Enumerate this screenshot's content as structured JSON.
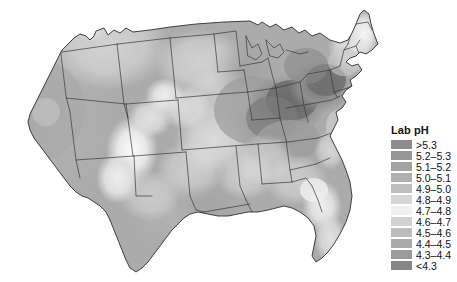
{
  "figure": {
    "type": "choropleth-map",
    "region": "contiguous-united-states",
    "background_color": "#ffffff",
    "border_color": "#3a3a3a"
  },
  "legend": {
    "title": "Lab pH",
    "position": "right",
    "entries": [
      {
        "label": ">5.3",
        "color": "#8c8c8c"
      },
      {
        "label": "5.2–5.3",
        "color": "#969696"
      },
      {
        "label": "5.1–5.2",
        "color": "#a3a3a3"
      },
      {
        "label": "5.0–5.1",
        "color": "#b0b0b0"
      },
      {
        "label": "4.9–5.0",
        "color": "#bfbfbf"
      },
      {
        "label": "4.8–4.9",
        "color": "#d6d6d6"
      },
      {
        "label": "4.7–4.8",
        "color": "#f0f0f0"
      },
      {
        "label": "4.6–4.7",
        "color": "#d2d2d2"
      },
      {
        "label": "4.5–4.6",
        "color": "#bcbcbc"
      },
      {
        "label": "4.4–4.5",
        "color": "#ababab"
      },
      {
        "label": "4.3–4.4",
        "color": "#9a9a9a"
      },
      {
        "label": "<4.3",
        "color": "#858585"
      }
    ]
  },
  "chart_data": {
    "type": "heatmap",
    "title": "Lab pH",
    "subtitle": "",
    "xlabel": "",
    "ylabel": "",
    "variable": "Lab pH",
    "units": "pH",
    "map_projection": "albers-equal-area-conic",
    "legend_position": "right",
    "grid": false,
    "value_range": [
      4.3,
      5.3
    ],
    "class_breaks": [
      4.3,
      4.4,
      4.5,
      4.6,
      4.7,
      4.8,
      4.9,
      5.0,
      5.1,
      5.2,
      5.3
    ],
    "class_labels": [
      ">5.3",
      "5.2–5.3",
      "5.1–5.2",
      "5.0–5.1",
      "4.9–5.0",
      "4.8–4.9",
      "4.7–4.8",
      "4.6–4.7",
      "4.5–4.6",
      "4.4–4.5",
      "4.3–4.4",
      "<4.3"
    ],
    "class_colors": [
      "#8c8c8c",
      "#969696",
      "#a3a3a3",
      "#b0b0b0",
      "#bfbfbf",
      "#d6d6d6",
      "#f0f0f0",
      "#d2d2d2",
      "#bcbcbc",
      "#ababab",
      "#9a9a9a",
      "#858585"
    ],
    "regions": [
      {
        "name": "Pacific Northwest",
        "value": 5.25,
        "class": "5.2–5.3"
      },
      {
        "name": "Northern Rockies",
        "value": 5.15,
        "class": "5.1–5.2"
      },
      {
        "name": "California",
        "value": 5.1,
        "class": "5.0–5.1"
      },
      {
        "name": "Great Basin",
        "value": 5.15,
        "class": "5.1–5.2"
      },
      {
        "name": "Desert Southwest",
        "value": 4.95,
        "class": "4.9–5.0"
      },
      {
        "name": "Southern Rockies",
        "value": 4.8,
        "class": "4.7–4.8"
      },
      {
        "name": "High Plains",
        "value": 4.85,
        "class": "4.8–4.9"
      },
      {
        "name": "Northern Plains",
        "value": 5.0,
        "class": "5.0–5.1"
      },
      {
        "name": "Upper Midwest",
        "value": 4.85,
        "class": "4.8–4.9"
      },
      {
        "name": "Great Lakes",
        "value": 4.6,
        "class": "4.5–4.6"
      },
      {
        "name": "Ohio Valley",
        "value": 4.35,
        "class": "4.3–4.4"
      },
      {
        "name": "Mid-Atlantic",
        "value": 4.35,
        "class": "4.3–4.4"
      },
      {
        "name": "Northern Appalachians",
        "value": 4.3,
        "class": "<4.3"
      },
      {
        "name": "New England",
        "value": 4.7,
        "class": "4.7–4.8"
      },
      {
        "name": "Maine",
        "value": 4.9,
        "class": "4.8–4.9"
      },
      {
        "name": "Southeast",
        "value": 4.75,
        "class": "4.7–4.8"
      },
      {
        "name": "Florida Peninsula",
        "value": 4.95,
        "class": "4.9–5.0"
      },
      {
        "name": "Gulf Coast",
        "value": 4.85,
        "class": "4.8–4.9"
      },
      {
        "name": "Texas",
        "value": 4.95,
        "class": "4.9–5.0"
      }
    ]
  }
}
